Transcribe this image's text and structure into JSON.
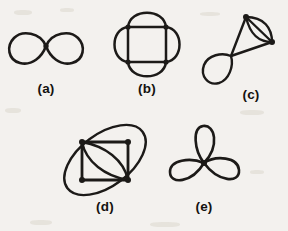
{
  "page": {
    "background_color": "#f3f1ee",
    "ink_color": "#1c1a18",
    "width": 288,
    "height": 231
  },
  "labels": {
    "a": "(a)",
    "b": "(b)",
    "c": "(c)",
    "d": "(d)",
    "e": "(e)"
  },
  "figures": [
    {
      "id": "a",
      "label": "(a)",
      "name": "figure-eight-two-loops",
      "description": "Two round lobes joined at a single central vertex, forming a figure-eight / infinity shape",
      "vertices": 1,
      "loops": 2,
      "center": [
        46,
        46
      ],
      "label_position": [
        46,
        93
      ]
    },
    {
      "id": "b",
      "label": "(b)",
      "name": "square-with-four-outer-petals",
      "description": "A square with vertices at its four corners and four arcs bulging outward from each side",
      "vertices": 4,
      "loops": 4,
      "center": [
        147,
        44
      ],
      "label_position": [
        147,
        93
      ]
    },
    {
      "id": "c",
      "label": "(c)",
      "name": "lens-with-figure-eight-tail",
      "description": "Two vertices joined by two arcs and a straight chord forming a lens, with edges descending to a crossing that makes a lower-left loop",
      "vertices": 2,
      "loops": 2,
      "center": [
        243,
        46
      ],
      "label_position": [
        251,
        99
      ]
    },
    {
      "id": "d",
      "label": "(d)",
      "name": "ellipse-square-with-inner-lens",
      "description": "A tilted ellipse through two opposite square corners, a square, and a lens of two arcs along the square diagonal",
      "vertices": 4,
      "loops": 3,
      "center": [
        105,
        160
      ],
      "label_position": [
        105,
        211
      ]
    },
    {
      "id": "e",
      "label": "(e)",
      "name": "trefoil-three-petals",
      "description": "Three teardrop petals meeting at one central vertex: one pointing up, one lower-left, one lower-right",
      "vertices": 1,
      "loops": 3,
      "center": [
        216,
        163
      ],
      "label_position": [
        204,
        211
      ]
    }
  ]
}
